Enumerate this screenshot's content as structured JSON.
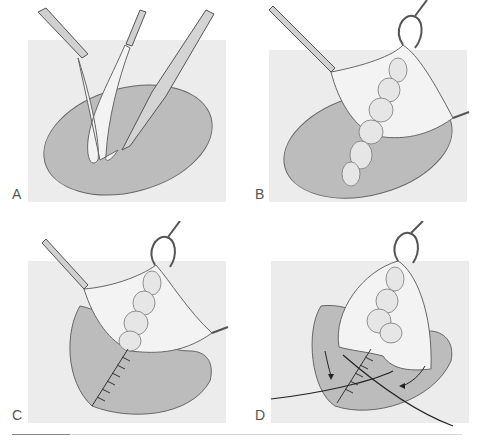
{
  "figure": {
    "panels": [
      {
        "label": "A",
        "description": "Oval skin incision; forceps lift a strip of tissue while a scalpel dissects beneath it"
      },
      {
        "label": "B",
        "description": "Skin flap retracted by forceps and hook; lobulated fatty mass dissected from base"
      },
      {
        "label": "C",
        "description": "Flap retracted; base closed with interrupted sutures"
      },
      {
        "label": "D",
        "description": "Flap folded down with suture threads; arrows indicate direction of closure"
      }
    ],
    "colors": {
      "background_field": "#ebebeb",
      "wound_bed": "#b8b8b8",
      "outline": "#555555",
      "tissue": "#f4f4f4",
      "instrument": "#cfcfcf"
    }
  }
}
